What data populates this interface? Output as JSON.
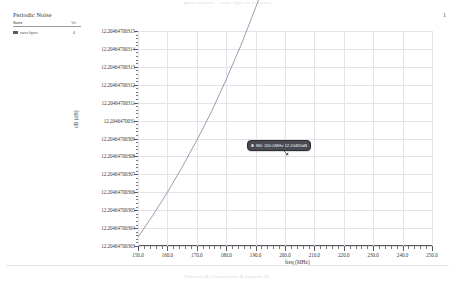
{
  "page": {
    "top_caption": "pnoise analysis  —  noise figure vs frequency",
    "bottom_caption": "Virtuoso (R) Visualization & Analysis XL",
    "page_number": "1"
  },
  "legend": {
    "title": "Periodic Noise",
    "header": {
      "name": "Name",
      "value": "Vis"
    },
    "rows": [
      {
        "label": "noise figure",
        "value": "4",
        "color": "#5a5a66"
      }
    ]
  },
  "marker": {
    "label": "M0: 200.0MHz 12.20465dB",
    "x_value": 200.0,
    "y_value": 12.20465
  },
  "chart_data": {
    "type": "line",
    "title": "",
    "xlabel": "freq (MHz)",
    "ylabel": "dB (dB)",
    "xlim": [
      150.0,
      250.0
    ],
    "ylim": [
      12.20464700303,
      12.20464700315
    ],
    "grid": true,
    "legend_position": "top-left-panel",
    "x_ticks": [
      150.0,
      160.0,
      170.0,
      180.0,
      190.0,
      200.0,
      210.0,
      220.0,
      230.0,
      240.0,
      250.0
    ],
    "x_tick_labels": [
      "150.0",
      "160.0",
      "170.0",
      "180.0",
      "190.0",
      "200.0",
      "210.0",
      "220.0",
      "230.0",
      "240.0",
      "250.0"
    ],
    "y_ticks": [
      12.20464700303,
      12.20464700304,
      12.20464700305,
      12.20464700306,
      12.20464700307,
      12.20464700308,
      12.20464700309,
      12.2046470031,
      12.20464700311,
      12.20464700312,
      12.20464700313,
      12.20464700314,
      12.20464700315
    ],
    "y_tick_labels": [
      "12.20464700303",
      "12.20464700304",
      "12.20464700305",
      "12.20464700306",
      "12.20464700307",
      "12.20464700308",
      "12.20464700309",
      "12.2046470031",
      "12.20464700311",
      "12.20464700312",
      "12.20464700313",
      "12.20464700314",
      "12.20464700315"
    ],
    "series": [
      {
        "name": "noise figure",
        "color": "#8a7f9a",
        "x": [
          150,
          155,
          160,
          165,
          170,
          175,
          180,
          185,
          190,
          195,
          200,
          205,
          210,
          215,
          220,
          225,
          230,
          235,
          240,
          245,
          250
        ],
        "y": [
          12.204647003035,
          12.204647003047,
          12.20464700306,
          12.204647003074,
          12.204647003089,
          12.204647003105,
          12.204647003123,
          12.204647003142,
          12.204647003163,
          12.204647003185,
          12.204647003208,
          12.204647003233,
          12.204647003259,
          12.204647003287,
          12.204647003316,
          12.204647003347,
          12.204647003379,
          12.204647003413,
          12.204647003448,
          12.204647003485,
          12.204647003524
        ]
      }
    ]
  }
}
